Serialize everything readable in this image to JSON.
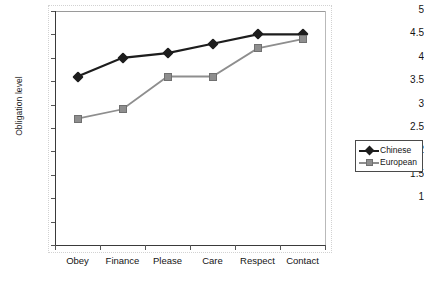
{
  "chart_data": {
    "type": "line",
    "title": "",
    "xlabel": "",
    "ylabel": "Obligation level",
    "categories": [
      "Obey",
      "Finance",
      "Please",
      "Care",
      "Respect",
      "Contact"
    ],
    "series": [
      {
        "name": "Chinese",
        "values": [
          3.6,
          4.0,
          4.1,
          4.3,
          4.5,
          4.5
        ],
        "color": "#1d1d1d",
        "marker": "diamond"
      },
      {
        "name": "European",
        "values": [
          2.7,
          2.9,
          3.6,
          3.6,
          4.2,
          4.4
        ],
        "color": "#8e8e8e",
        "marker": "square"
      }
    ],
    "ylim": [
      0,
      5
    ],
    "ytick_values": [
      0,
      0.5,
      1,
      1.5,
      2,
      2.5,
      3,
      3.5,
      4,
      4.5,
      5
    ],
    "ytick_labels": [
      "",
      "",
      "1",
      "1.5",
      "2",
      "2.5",
      "3",
      "3.5",
      "4",
      "4.5",
      "5"
    ],
    "grid": false,
    "legend_position": "right"
  },
  "legend": {
    "entries": [
      {
        "label": "Chinese"
      },
      {
        "label": "European"
      }
    ]
  }
}
